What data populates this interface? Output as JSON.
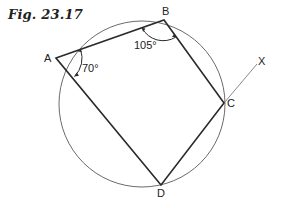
{
  "caption": "Fig. 23.17",
  "points": {
    "A": {
      "label": "A",
      "x": 56,
      "y": 58
    },
    "B": {
      "label": "B",
      "x": 164,
      "y": 20
    },
    "C": {
      "label": "C",
      "x": 224,
      "y": 103
    },
    "D": {
      "label": "D",
      "x": 161,
      "y": 185
    },
    "X": {
      "label": "X",
      "x": 257,
      "y": 64
    }
  },
  "circle": {
    "cx": 142,
    "cy": 104,
    "r": 83
  },
  "angles": {
    "A": "70°",
    "B": "105°"
  },
  "colors": {
    "line": "#2a2a2a",
    "circle": "#6a6a6a",
    "extension": "#8a8a8a"
  }
}
